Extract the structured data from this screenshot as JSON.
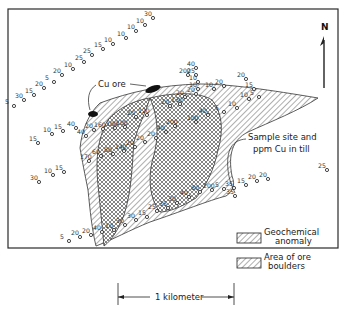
{
  "map": {
    "north_label": "N",
    "callouts": {
      "cu_ore": "Cu ore",
      "sample_site_line1": "Sample site and",
      "sample_site_line2": "ppm Cu in till"
    },
    "legend": {
      "geochemical_anomaly_line1": "Geochemical",
      "geochemical_anomaly_line2": "anomaly",
      "ore_boulders_line1": "Area of ore",
      "ore_boulders_line2": "boulders"
    },
    "scale_bar": {
      "label": "1 kilometer"
    },
    "colors": {
      "ink": "#2a2a2a",
      "background": "#ffffff"
    },
    "sample_sites": [
      {
        "v": "30",
        "x": 153,
        "y": 18
      },
      {
        "v": "10",
        "x": 145,
        "y": 25
      },
      {
        "v": "10",
        "x": 136,
        "y": 31
      },
      {
        "v": "10",
        "x": 126,
        "y": 38
      },
      {
        "v": "10",
        "x": 113,
        "y": 44
      },
      {
        "v": "15",
        "x": 103,
        "y": 49
      },
      {
        "v": "25",
        "x": 92,
        "y": 55
      },
      {
        "v": "25",
        "x": 84,
        "y": 62
      },
      {
        "v": "10",
        "x": 73,
        "y": 69
      },
      {
        "v": "20",
        "x": 62,
        "y": 75
      },
      {
        "v": "5",
        "x": 54,
        "y": 82
      },
      {
        "v": "20",
        "x": 44,
        "y": 88
      },
      {
        "v": "15",
        "x": 34,
        "y": 95
      },
      {
        "v": "30",
        "x": 24,
        "y": 100
      },
      {
        "v": "5",
        "x": 14,
        "y": 106
      },
      {
        "v": "200",
        "x": 188,
        "y": 75
      },
      {
        "v": "40",
        "x": 196,
        "y": 68
      },
      {
        "v": "25",
        "x": 196,
        "y": 75
      },
      {
        "v": "10",
        "x": 198,
        "y": 82
      },
      {
        "v": "10",
        "x": 198,
        "y": 89
      },
      {
        "v": "10",
        "x": 214,
        "y": 89
      },
      {
        "v": "20",
        "x": 224,
        "y": 86
      },
      {
        "v": "20",
        "x": 246,
        "y": 79
      },
      {
        "v": "15",
        "x": 254,
        "y": 89
      },
      {
        "v": "10",
        "x": 249,
        "y": 99
      },
      {
        "v": "5",
        "x": 259,
        "y": 97
      },
      {
        "v": "10",
        "x": 237,
        "y": 108
      },
      {
        "v": "5",
        "x": 224,
        "y": 112
      },
      {
        "v": "20",
        "x": 185,
        "y": 97
      },
      {
        "v": "20",
        "x": 196,
        "y": 94
      },
      {
        "v": "130",
        "x": 180,
        "y": 104
      },
      {
        "v": "20",
        "x": 170,
        "y": 106
      },
      {
        "v": "120",
        "x": 147,
        "y": 115
      },
      {
        "v": "20",
        "x": 136,
        "y": 117
      },
      {
        "v": "100",
        "x": 125,
        "y": 127
      },
      {
        "v": "100",
        "x": 115,
        "y": 128
      },
      {
        "v": "40",
        "x": 208,
        "y": 115
      },
      {
        "v": "100",
        "x": 196,
        "y": 122
      },
      {
        "v": "200",
        "x": 175,
        "y": 126
      },
      {
        "v": "40",
        "x": 166,
        "y": 132
      },
      {
        "v": "20",
        "x": 156,
        "y": 138
      },
      {
        "v": "20",
        "x": 145,
        "y": 142
      },
      {
        "v": "20",
        "x": 135,
        "y": 147
      },
      {
        "v": "140",
        "x": 124,
        "y": 151
      },
      {
        "v": "80",
        "x": 113,
        "y": 154
      },
      {
        "v": "60",
        "x": 101,
        "y": 156
      },
      {
        "v": "170",
        "x": 89,
        "y": 161
      },
      {
        "v": "40",
        "x": 86,
        "y": 136
      },
      {
        "v": "40",
        "x": 76,
        "y": 128
      },
      {
        "v": "20",
        "x": 94,
        "y": 130
      },
      {
        "v": "160",
        "x": 103,
        "y": 129
      },
      {
        "v": "15",
        "x": 63,
        "y": 131
      },
      {
        "v": "10",
        "x": 52,
        "y": 134
      },
      {
        "v": "15",
        "x": 38,
        "y": 143
      },
      {
        "v": "15",
        "x": 64,
        "y": 172
      },
      {
        "v": "10",
        "x": 53,
        "y": 175
      },
      {
        "v": "30",
        "x": 39,
        "y": 182
      },
      {
        "v": "25",
        "x": 327,
        "y": 170
      },
      {
        "v": "20",
        "x": 268,
        "y": 179
      },
      {
        "v": "20",
        "x": 257,
        "y": 181
      },
      {
        "v": "15",
        "x": 246,
        "y": 185
      },
      {
        "v": "35",
        "x": 234,
        "y": 188
      },
      {
        "v": "5",
        "x": 224,
        "y": 189
      },
      {
        "v": "200",
        "x": 212,
        "y": 190
      },
      {
        "v": "35",
        "x": 235,
        "y": 196
      },
      {
        "v": "80",
        "x": 200,
        "y": 192
      },
      {
        "v": "40",
        "x": 189,
        "y": 197
      },
      {
        "v": "30",
        "x": 177,
        "y": 203
      },
      {
        "v": "35",
        "x": 168,
        "y": 208
      },
      {
        "v": "25",
        "x": 157,
        "y": 211
      },
      {
        "v": "15",
        "x": 147,
        "y": 217
      },
      {
        "v": "30",
        "x": 136,
        "y": 220
      },
      {
        "v": "30",
        "x": 125,
        "y": 225
      },
      {
        "v": "10",
        "x": 114,
        "y": 230
      },
      {
        "v": "40",
        "x": 102,
        "y": 232
      },
      {
        "v": "20",
        "x": 91,
        "y": 235
      },
      {
        "v": "20",
        "x": 80,
        "y": 237
      },
      {
        "v": "5",
        "x": 69,
        "y": 241
      }
    ]
  }
}
